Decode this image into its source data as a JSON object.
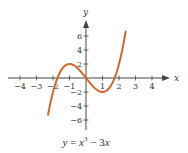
{
  "chart_data": {
    "type": "line",
    "title": "",
    "caption": "y = x^3 - 3x",
    "caption_parts": {
      "lhs": "y",
      "eq": "=",
      "x1": "x",
      "exp": "3",
      "minus": "−",
      "coef": "3",
      "x2": "x"
    },
    "function": "x^3 - 3x",
    "xlabel": "x",
    "ylabel": "y",
    "xlim": [
      -4.2,
      4.8
    ],
    "ylim": [
      -7.2,
      7.8
    ],
    "domain_plotted": [
      -2.3,
      2.4
    ],
    "x_ticks": [
      -4,
      -3,
      -2,
      -1,
      1,
      2,
      3,
      4
    ],
    "x_tick_labels": [
      "−4",
      "−3",
      "−2",
      "−1",
      "1",
      "2",
      "3",
      "4"
    ],
    "y_ticks": [
      -6,
      -4,
      -2,
      2,
      4,
      6
    ],
    "y_tick_labels": [
      "−6",
      "−4",
      "−2",
      "2",
      "4",
      "6"
    ],
    "grid": false,
    "series": [
      {
        "name": "y = x^3 - 3x",
        "color": "#D0672C",
        "x": [
          -2.3,
          -2.0,
          -1.5,
          -1.0,
          -0.5,
          0.0,
          0.5,
          1.0,
          1.5,
          2.0,
          2.4
        ],
        "y": [
          -5.27,
          -2.0,
          1.125,
          2.0,
          1.375,
          0.0,
          -1.375,
          -2.0,
          -1.125,
          2.0,
          6.62
        ]
      }
    ],
    "key_points": {
      "local_max": [
        -1,
        2
      ],
      "local_min": [
        1,
        -2
      ],
      "roots": [
        -1.732,
        0,
        1.732
      ]
    }
  },
  "style": {
    "curve_color": "#D0672C",
    "axis_color": "#444444"
  }
}
